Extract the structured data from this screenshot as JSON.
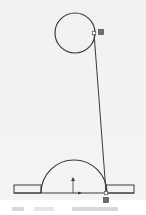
{
  "colors": {
    "background": "#f2f2f2",
    "stroke": "#3a3a3a",
    "marker_fill": "#6e6e6e",
    "status_blur": "#d8d8d8"
  },
  "sketch": {
    "circle": {
      "cx": 75,
      "cy": 33,
      "r": 20
    },
    "tangent_line": {
      "x1": 94,
      "y1": 33,
      "x2": 106,
      "y2": 192
    },
    "base_line": {
      "x1": 14,
      "y1": 193,
      "x2": 134,
      "y2": 193
    },
    "left_rect": {
      "x": 14,
      "y": 185,
      "w": 27,
      "h": 8
    },
    "right_rect": {
      "x": 106,
      "y": 185,
      "w": 28,
      "h": 8
    },
    "arc": {
      "cx": 74,
      "cy": 193,
      "r": 33
    },
    "origin_arrow_vertical": {
      "x": 73,
      "y1": 193,
      "y2": 177
    },
    "origin_arrow_horizontal": {
      "x1": 73,
      "x2": 82,
      "y": 193
    },
    "markers": [
      {
        "name": "coincident-point-top",
        "x": 94,
        "y": 33,
        "filled": false
      },
      {
        "name": "constraint-badge-top",
        "x": 101,
        "y": 32,
        "filled": true
      },
      {
        "name": "coincident-point-bottom",
        "x": 106,
        "y": 193,
        "filled": false
      },
      {
        "name": "constraint-badge-bottom",
        "x": 106,
        "y": 200,
        "filled": true
      }
    ]
  },
  "status_bar": {
    "text": "(illegible status text)"
  }
}
